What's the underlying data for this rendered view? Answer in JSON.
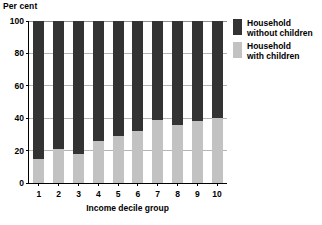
{
  "chart_data": {
    "type": "bar",
    "stacked": true,
    "title": "",
    "xlabel": "Income decile group",
    "ylabel": "Per cent",
    "categories": [
      "1",
      "2",
      "3",
      "4",
      "5",
      "6",
      "7",
      "8",
      "9",
      "10"
    ],
    "series": [
      {
        "name": "Household with children",
        "color": "#c2c2c2",
        "values": [
          15,
          21,
          18,
          26,
          29,
          32,
          39,
          36,
          38,
          40
        ]
      },
      {
        "name": "Household without children",
        "color": "#333333",
        "values": [
          85,
          79,
          82,
          74,
          71,
          68,
          61,
          64,
          62,
          60
        ]
      }
    ],
    "ylim": [
      0,
      100
    ],
    "yticks": [
      0,
      20,
      40,
      60,
      80,
      100
    ],
    "ytick_labels": [
      "0",
      "20",
      "40",
      "60",
      "80",
      "100"
    ],
    "grid": true,
    "legend_position": "right"
  },
  "legend": {
    "entries": [
      {
        "label": "Household\nwithout children",
        "color": "#333333"
      },
      {
        "label": "Household\nwith children",
        "color": "#c2c2c2"
      }
    ]
  },
  "colors": {
    "dark_segment": "#333333",
    "light_segment": "#c2c2c2",
    "gridline": "#b5b5b5",
    "axis": "#000000",
    "background": "#ffffff"
  }
}
